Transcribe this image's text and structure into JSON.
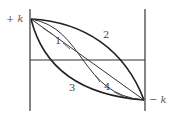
{
  "diagram": {
    "axis_labels": {
      "top": "+ k",
      "bottom": "− k"
    },
    "curve_labels": [
      "1",
      "2",
      "3",
      "4"
    ],
    "colors": {
      "line": "#222222",
      "background": "#ffffff"
    }
  }
}
